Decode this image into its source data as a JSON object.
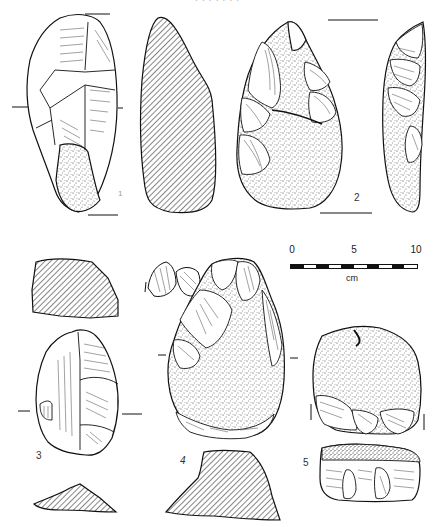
{
  "page": {
    "header_fragment": "· · · · · · ·",
    "figures": [
      {
        "id": "1",
        "label": "1"
      },
      {
        "id": "2",
        "label": "2"
      },
      {
        "id": "3",
        "label": "3"
      },
      {
        "id": "4",
        "label": "4"
      },
      {
        "id": "5",
        "label": "5"
      }
    ],
    "scale_bar": {
      "ticks": [
        "0",
        "5",
        "10"
      ],
      "unit": "cm",
      "segments": 10
    },
    "colors": {
      "ink": "#1a1a1a",
      "paper": "#ffffff"
    }
  }
}
